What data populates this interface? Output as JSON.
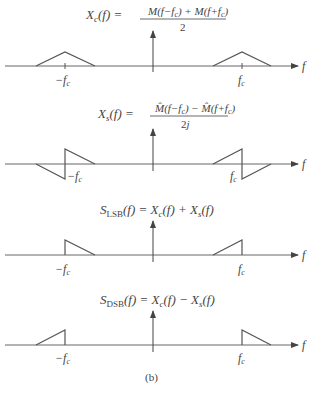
{
  "figure": {
    "caption": "(b)",
    "axis_label": "f",
    "panels": [
      {
        "id": "xc",
        "eq_lhs": "X_c(f) =",
        "eq_num": "M(f−f_c) + M(f+f_c)",
        "eq_den": "2",
        "neg_label": "−f_c",
        "pos_label": "f_c",
        "shape": "symmetric triangles at ±f_c"
      },
      {
        "id": "xs",
        "eq_lhs": "X_s(f) =",
        "eq_num": "M̂(f−f_c) − M̂(f+f_c)",
        "eq_den": "2j",
        "neg_label": "−f_c",
        "pos_label": "f_c",
        "shape": "antisymmetric (Hilbert) shapes at ±f_c"
      },
      {
        "id": "lsb",
        "eq": "S_LSB(f) = X_c(f) + X_s(f)",
        "neg_label": "−f_c",
        "pos_label": "f_c",
        "shape": "lower sidebands only"
      },
      {
        "id": "dsb",
        "eq": "S_DSB(f) = X_c(f) − X_s(f)",
        "neg_label": "−f_c",
        "pos_label": "f_c",
        "shape": "upper sidebands only"
      }
    ]
  }
}
